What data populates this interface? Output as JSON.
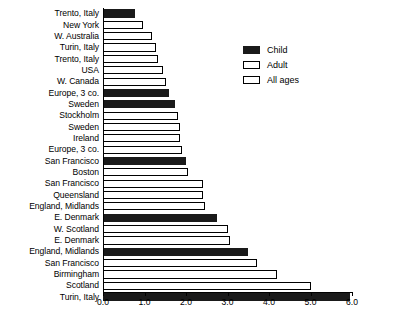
{
  "chart_data": {
    "type": "bar",
    "orientation": "horizontal",
    "title": "",
    "xlabel": "",
    "ylabel": "",
    "xlim": [
      0.0,
      6.0
    ],
    "xticks": [
      "0.0",
      "1.0",
      "2.0",
      "3.0",
      "4.0",
      "5.0",
      "6.0"
    ],
    "xtick_values": [
      0.0,
      1.0,
      2.0,
      3.0,
      4.0,
      5.0,
      6.0
    ],
    "grid": false,
    "legend_position": "upper-right-inside",
    "legend": [
      {
        "label": "Child",
        "fill": "#1a1a1a",
        "style": "filled"
      },
      {
        "label": "Adult",
        "fill": "#ffffff",
        "style": "outline"
      },
      {
        "label": "All ages",
        "fill": "#ffffff",
        "style": "outline"
      }
    ],
    "categories": [
      "Trento, Italy",
      "New York",
      "W. Australia",
      "Turin, Italy",
      "Trento, Italy",
      "USA",
      "W. Canada",
      "Europe, 3 co.",
      "Sweden",
      "Stockholm",
      "Sweden",
      "Ireland",
      "Europe, 3 co.",
      "San Francisco",
      "Boston",
      "San Francisco",
      "Queensland",
      "England, Midlands",
      "E. Denmark",
      "W. Scotland",
      "E. Denmark",
      "England, Midlands",
      "San Francisco",
      "Birmingham",
      "Scotland",
      "Turin, Italy"
    ],
    "values": [
      0.78,
      0.96,
      1.18,
      1.27,
      1.32,
      1.44,
      1.53,
      1.6,
      1.73,
      1.8,
      1.86,
      1.86,
      1.9,
      2.0,
      2.05,
      2.4,
      2.42,
      2.45,
      2.75,
      3.0,
      3.05,
      3.5,
      3.7,
      4.2,
      5.0,
      5.95
    ],
    "series_key": [
      "Child",
      "Adult",
      "Adult",
      "Adult",
      "Adult",
      "Adult",
      "Adult",
      "Child",
      "Child",
      "Adult",
      "Adult",
      "Adult",
      "Adult",
      "Child",
      "Adult",
      "Adult",
      "Adult",
      "Adult",
      "Child",
      "Adult",
      "Adult",
      "Child",
      "Adult",
      "Adult",
      "Adult",
      "Child"
    ]
  }
}
